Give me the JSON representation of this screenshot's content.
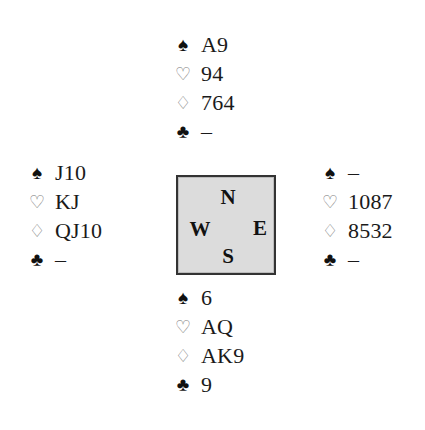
{
  "diagram": {
    "type": "bridge-deal",
    "suit_symbols": {
      "spades": "♠",
      "hearts": "♡",
      "diamonds": "♢",
      "clubs": "♣"
    },
    "compass": {
      "north": "N",
      "south": "S",
      "east": "E",
      "west": "W",
      "fill_color": "#dcdcdc"
    },
    "hands": {
      "north": {
        "spades": "A9",
        "hearts": "94",
        "diamonds": "764",
        "clubs": "–"
      },
      "west": {
        "spades": "J10",
        "hearts": "KJ",
        "diamonds": "QJ10",
        "clubs": "–"
      },
      "east": {
        "spades": "–",
        "hearts": "1087",
        "diamonds": "8532",
        "clubs": "–"
      },
      "south": {
        "spades": "6",
        "hearts": "AQ",
        "diamonds": "AK9",
        "clubs": "9"
      }
    }
  }
}
